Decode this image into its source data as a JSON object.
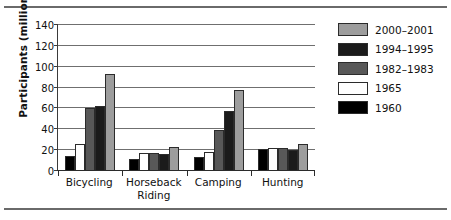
{
  "chart_data": {
    "type": "bar",
    "title": "",
    "xlabel": "",
    "ylabel": "Participants (millions)",
    "categories": [
      "Bicycling",
      "Horseback Riding",
      "Camping",
      "Hunting"
    ],
    "category_lines": [
      [
        "Bicycling"
      ],
      [
        "Horseback",
        "Riding"
      ],
      [
        "Camping"
      ],
      [
        "Hunting"
      ]
    ],
    "series": [
      {
        "name": "1960",
        "color": "#000000",
        "values": [
          14,
          12,
          13,
          21
        ]
      },
      {
        "name": "1965",
        "color": "#ffffff",
        "values": [
          26,
          17,
          18,
          22.5
        ]
      },
      {
        "name": "1982–1983",
        "color": "#585858",
        "values": [
          60.5,
          17,
          39,
          22
        ]
      },
      {
        "name": "1994–1995",
        "color": "#1b1b1b",
        "values": [
          62,
          16,
          57.5,
          20.5
        ]
      },
      {
        "name": "2000–2001",
        "color": "#9d9d9d",
        "values": [
          93.5,
          23,
          78,
          26
        ]
      }
    ],
    "ylim": [
      0,
      140
    ],
    "yticks": [
      0,
      20,
      40,
      60,
      80,
      100,
      120,
      140
    ],
    "ytick_labels": [
      "0",
      "20",
      "40",
      "60",
      "80",
      "100",
      "120",
      "140"
    ],
    "grid": true,
    "legend_position": "right",
    "legend_order": [
      "2000–2001",
      "1994–1995",
      "1982–1983",
      "1965",
      "1960"
    ],
    "bar_order": [
      "1960",
      "1965",
      "1982–1983",
      "1994–1995",
      "2000–2001"
    ]
  },
  "legend": {
    "entries": [
      {
        "label": "2000–2001",
        "color": "#9d9d9d",
        "class": "c0"
      },
      {
        "label": "1994–1995",
        "color": "#1b1b1b",
        "class": "c1"
      },
      {
        "label": "1982–1983",
        "color": "#585858",
        "class": "c2"
      },
      {
        "label": "1965",
        "color": "#ffffff",
        "class": "c3"
      },
      {
        "label": "1960",
        "color": "#000000",
        "class": "c4"
      }
    ]
  }
}
